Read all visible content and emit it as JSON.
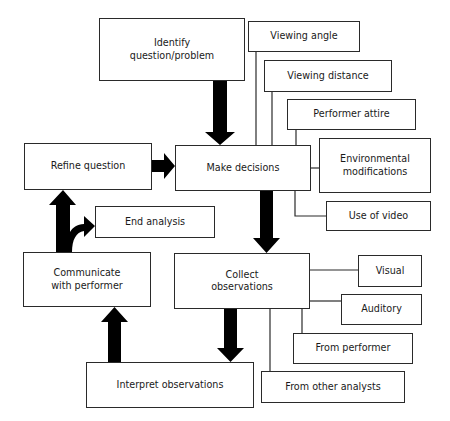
{
  "diagram": {
    "type": "flowchart",
    "nodes": [
      {
        "id": "identify",
        "label": "Identify\nquestion/problem"
      },
      {
        "id": "refine",
        "label": "Refine question"
      },
      {
        "id": "make_decisions",
        "label": "Make decisions"
      },
      {
        "id": "end_analysis",
        "label": "End analysis"
      },
      {
        "id": "communicate",
        "label": "Communicate\nwith performer"
      },
      {
        "id": "collect",
        "label": "Collect\nobservations"
      },
      {
        "id": "interpret",
        "label": "Interpret observations"
      },
      {
        "id": "viewing_angle",
        "label": "Viewing angle"
      },
      {
        "id": "viewing_distance",
        "label": "Viewing distance"
      },
      {
        "id": "performer_attire",
        "label": "Performer attire"
      },
      {
        "id": "environmental",
        "label": "Environmental\nmodifications"
      },
      {
        "id": "use_of_video",
        "label": "Use of video"
      },
      {
        "id": "visual",
        "label": "Visual"
      },
      {
        "id": "auditory",
        "label": "Auditory"
      },
      {
        "id": "from_performer",
        "label": "From performer"
      },
      {
        "id": "from_other_analysts",
        "label": "From other analysts"
      }
    ],
    "edges": [
      {
        "from": "identify",
        "to": "make_decisions",
        "style": "thick-arrow"
      },
      {
        "from": "refine",
        "to": "make_decisions",
        "style": "thick-arrow"
      },
      {
        "from": "make_decisions",
        "to": "collect",
        "style": "thick-arrow"
      },
      {
        "from": "collect",
        "to": "interpret",
        "style": "thick-arrow"
      },
      {
        "from": "interpret",
        "to": "communicate",
        "style": "thick-arrow"
      },
      {
        "from": "communicate",
        "to": "refine",
        "style": "thick-arrow"
      },
      {
        "from": "communicate",
        "to": "end_analysis",
        "style": "thick-curved-arrow"
      },
      {
        "from": "make_decisions",
        "to": "viewing_angle",
        "style": "line"
      },
      {
        "from": "make_decisions",
        "to": "viewing_distance",
        "style": "line"
      },
      {
        "from": "make_decisions",
        "to": "performer_attire",
        "style": "line"
      },
      {
        "from": "make_decisions",
        "to": "environmental",
        "style": "line"
      },
      {
        "from": "make_decisions",
        "to": "use_of_video",
        "style": "line"
      },
      {
        "from": "collect",
        "to": "visual",
        "style": "line"
      },
      {
        "from": "collect",
        "to": "auditory",
        "style": "line"
      },
      {
        "from": "collect",
        "to": "from_performer",
        "style": "line"
      },
      {
        "from": "collect",
        "to": "from_other_analysts",
        "style": "line"
      }
    ]
  },
  "labels": {
    "identify_1": "Identify",
    "identify_2": "question/problem",
    "refine": "Refine question",
    "make_decisions": "Make decisions",
    "end_analysis": "End analysis",
    "communicate_1": "Communicate",
    "communicate_2": "with performer",
    "collect_1": "Collect",
    "collect_2": "observations",
    "interpret": "Interpret observations",
    "viewing_angle": "Viewing angle",
    "viewing_distance": "Viewing distance",
    "performer_attire": "Performer attire",
    "environmental_1": "Environmental",
    "environmental_2": "modifications",
    "use_of_video": "Use of video",
    "visual": "Visual",
    "auditory": "Auditory",
    "from_performer": "From performer",
    "from_other_analysts": "From other analysts"
  },
  "colors": {
    "line": "#2a2a2a",
    "arrow": "#000000",
    "background": "#ffffff"
  }
}
